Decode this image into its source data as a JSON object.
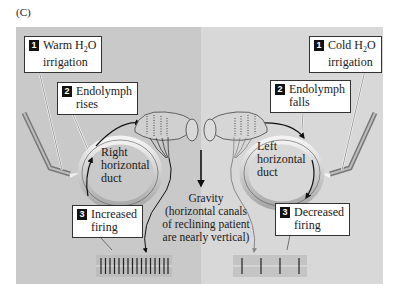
{
  "figure": {
    "panel_label": "(C)",
    "left_panel": {
      "side": "right",
      "color": "#c9c9c9",
      "callouts": [
        {
          "number": "1",
          "line1_prefix": "Warm H",
          "line1_sub": "2",
          "line1_suffix": "O",
          "line2": "irrigation"
        },
        {
          "number": "2",
          "line1": "Endolymph",
          "line2": "rises"
        },
        {
          "number": "3",
          "line1": "Increased",
          "line2": "firing"
        }
      ],
      "duct_label": [
        "Right",
        "horizontal",
        "duct"
      ],
      "firing_spikes": 16
    },
    "right_panel": {
      "side": "left",
      "color": "#d8d8d8",
      "callouts": [
        {
          "number": "1",
          "line1_prefix": "Cold H",
          "line1_sub": "2",
          "line1_suffix": "O",
          "line2": "irrigation"
        },
        {
          "number": "2",
          "line1": "Endolymph",
          "line2": "falls"
        },
        {
          "number": "3",
          "line1": "Decreased",
          "line2": "firing"
        }
      ],
      "duct_label": [
        "Left",
        "horizontal",
        "duct"
      ],
      "firing_spikes": 4
    },
    "gravity": {
      "line1": "Gravity",
      "line2": "(horizontal canals",
      "line3": "of reclining patient",
      "line4": "are nearly vertical)"
    }
  }
}
